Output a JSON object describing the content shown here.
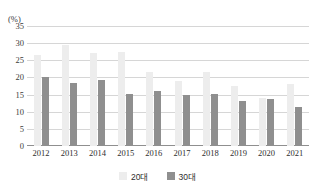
{
  "chart_data": {
    "type": "bar",
    "title": "",
    "cut_off_title": "",
    "xlabel": "",
    "ylabel": "(%)",
    "unit_label": "(%)",
    "categories": [
      "2012",
      "2013",
      "2014",
      "2015",
      "2016",
      "2017",
      "2018",
      "2019",
      "2020",
      "2021"
    ],
    "ylim": [
      0,
      35
    ],
    "yticks": [
      35,
      30,
      25,
      20,
      15,
      10,
      5,
      0
    ],
    "ytick_labels": [
      "35",
      "30",
      "25",
      "20",
      "15",
      "10",
      "5",
      "0"
    ],
    "grid": true,
    "legend_position": "bottom-center",
    "series": [
      {
        "name": "20대",
        "color": "#ededed",
        "values": [
          26.5,
          29.5,
          27.0,
          27.5,
          21.5,
          19.0,
          21.5,
          17.5,
          14.0,
          18.0
        ]
      },
      {
        "name": "30대",
        "color": "#8f8f8f",
        "values": [
          20.0,
          18.5,
          19.2,
          15.2,
          16.0,
          15.0,
          15.2,
          13.0,
          13.7,
          11.5
        ]
      }
    ]
  },
  "legend": {
    "items": [
      {
        "label": "20대",
        "color": "#ededed"
      },
      {
        "label": "30대",
        "color": "#8f8f8f"
      }
    ]
  },
  "colors": {
    "series_a": "#ededed",
    "series_b": "#8f8f8f",
    "gridline": "#d6d6d6",
    "axis": "#8f8f8f",
    "text": "#2e2e2e"
  }
}
